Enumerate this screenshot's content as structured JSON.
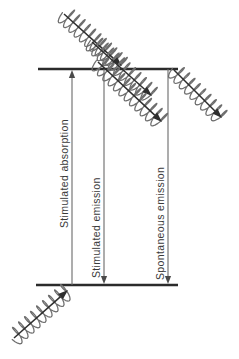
{
  "figure": {
    "background_color": "#ffffff",
    "level_line_color": "#2b2b2b",
    "transition_line_color": "#6a6a6a",
    "photon_wave_color": "#6e6e6e",
    "photon_arrow_color": "#2e2e2e",
    "label_color": "#3a3a3a",
    "label_orientation": "rotated-90-counterclockwise"
  },
  "levels": [
    {
      "name": "upper-energy-level",
      "label": "",
      "x1": 38,
      "x2": 178,
      "y": 69
    },
    {
      "name": "lower-energy-level",
      "label": "",
      "x1": 36,
      "x2": 178,
      "y": 285
    }
  ],
  "transitions": [
    {
      "id": "stimulated-absorption",
      "label": "Stimulated absorption",
      "direction": "up",
      "x": 72,
      "y_top": 70,
      "y_bottom": 285,
      "label_x": 68,
      "label_y": 228
    },
    {
      "id": "stimulated-emission",
      "label": "Stimulated emission",
      "direction": "down",
      "x": 104,
      "y_top": 69,
      "y_bottom": 284,
      "label_x": 100,
      "label_y": 278
    },
    {
      "id": "spontaneous-emission",
      "label": "Spontaneous emission",
      "direction": "down",
      "x": 168,
      "y_top": 69,
      "y_bottom": 284,
      "label_x": 164,
      "label_y": 280
    }
  ],
  "photons": [
    {
      "id": "incident-photon-absorption",
      "role": "photon absorbed by atom, arriving at lower level from lower-left",
      "x1": 14,
      "y1": 338,
      "x2": 68,
      "y2": 290,
      "coils": 9,
      "amplitude": 9
    },
    {
      "id": "incident-photon-stimulating",
      "role": "incident photon arriving at upper level from upper-left, triggers stimulated emission",
      "x1": 64,
      "y1": 14,
      "x2": 122,
      "y2": 66,
      "coils": 11,
      "amplitude": 10
    },
    {
      "id": "stimulated-photon-pair-a",
      "role": "first of two coherent photons emitted by stimulated emission",
      "x1": 92,
      "y1": 42,
      "x2": 152,
      "y2": 96,
      "coils": 11,
      "amplitude": 10
    },
    {
      "id": "stimulated-photon-pair-b",
      "role": "second of two coherent photons emitted by stimulated emission",
      "x1": 98,
      "y1": 62,
      "x2": 162,
      "y2": 122,
      "coils": 12,
      "amplitude": 10
    },
    {
      "id": "spontaneous-photon",
      "role": "photon emitted spontaneously from upper level, random direction",
      "x1": 174,
      "y1": 70,
      "x2": 222,
      "y2": 118,
      "coils": 9,
      "amplitude": 9
    }
  ]
}
